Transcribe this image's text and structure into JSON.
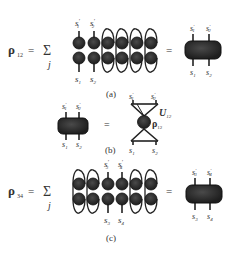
{
  "figure": {
    "panel_a": {
      "lhs_symbol": "ρ",
      "lhs_subscript": "12",
      "equals": "=",
      "sum_symbol": "Σ",
      "sum_index": "j",
      "top_labels": [
        "s",
        "s"
      ],
      "top_label_subs": [
        "1",
        "2"
      ],
      "bottom_labels": [
        "s",
        "s"
      ],
      "bottom_label_subs": [
        "1",
        "2"
      ],
      "rhs_top_labels": [
        "s",
        "s"
      ],
      "rhs_top_subs": [
        "1",
        "2"
      ],
      "rhs_bottom_labels": [
        "s",
        "s"
      ],
      "rhs_bottom_subs": [
        "1",
        "2"
      ],
      "caption": "(a)"
    },
    "panel_b": {
      "equals": "=",
      "lhs_top_labels": [
        "s",
        "s"
      ],
      "lhs_top_subs": [
        "1",
        "2"
      ],
      "lhs_bottom_labels": [
        "s",
        "s"
      ],
      "lhs_bottom_subs": [
        "1",
        "2"
      ],
      "rhs_top_labels": [
        "s",
        "s"
      ],
      "rhs_top_subs": [
        "1",
        "2"
      ],
      "rhs_bottom_labels": [
        "s",
        "s"
      ],
      "rhs_bottom_subs": [
        "1",
        "2"
      ],
      "u_label": "U",
      "u_sub": "12",
      "rho_label": "ρ",
      "rho_sub": "12",
      "caption": "(b)"
    },
    "panel_c": {
      "lhs_symbol": "ρ",
      "lhs_subscript": "34",
      "equals": "=",
      "sum_symbol": "Σ",
      "sum_index": "j",
      "top_labels": [
        "s",
        "s"
      ],
      "top_label_subs": [
        "3",
        "4"
      ],
      "bottom_labels": [
        "s",
        "s"
      ],
      "bottom_label_subs": [
        "3",
        "4"
      ],
      "rhs_top_labels": [
        "s",
        "s"
      ],
      "rhs_top_subs": [
        "3",
        "4"
      ],
      "rhs_bottom_labels": [
        "s",
        "s"
      ],
      "rhs_bottom_subs": [
        "3",
        "4"
      ],
      "caption": "(c)"
    },
    "prime": "′",
    "colors": {
      "node": "#2e2e2e",
      "node_edge": "#111111",
      "line": "#222222",
      "text": "#333333"
    }
  }
}
